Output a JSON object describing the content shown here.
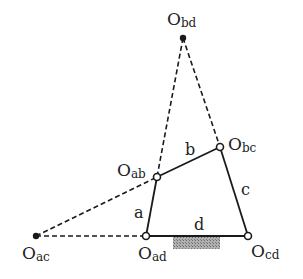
{
  "diagram": {
    "type": "four-bar linkage with instant centers",
    "joints": {
      "Obd": {
        "label": "O",
        "sub": "bd",
        "x": 183,
        "y": 38,
        "kind": "filled"
      },
      "Obc": {
        "label": "O",
        "sub": "bc",
        "x": 220,
        "y": 147,
        "kind": "hollow"
      },
      "Oab": {
        "label": "O",
        "sub": "ab",
        "x": 157,
        "y": 177,
        "kind": "hollow"
      },
      "Oad": {
        "label": "O",
        "sub": "ad",
        "x": 146,
        "y": 236,
        "kind": "hollow"
      },
      "Ocd": {
        "label": "O",
        "sub": "cd",
        "x": 248,
        "y": 236,
        "kind": "hollow"
      },
      "Oac": {
        "label": "O",
        "sub": "ac",
        "x": 36,
        "y": 236,
        "kind": "filled"
      }
    },
    "links": {
      "a": "a",
      "b": "b",
      "c": "c",
      "d": "d"
    },
    "colors": {
      "line": "#1a1a1a",
      "ground": "#9a9a9a"
    }
  }
}
